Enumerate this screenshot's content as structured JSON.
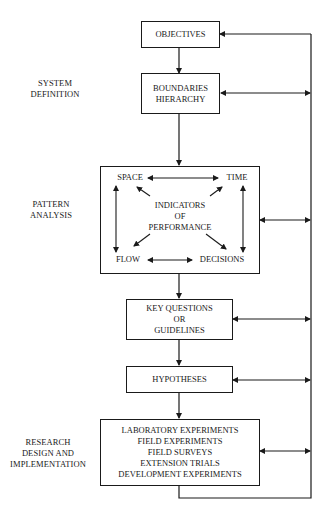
{
  "section_labels": {
    "system_definition": [
      "SYSTEM",
      "DEFINITION"
    ],
    "pattern_analysis": [
      "PATTERN",
      "ANALYSIS"
    ],
    "research_design": [
      "RESEARCH",
      "DESIGN AND",
      "IMPLEMENTATION"
    ]
  },
  "boxes": {
    "objectives": [
      "OBJECTIVES"
    ],
    "boundaries": [
      "BOUNDARIES",
      "HIERARCHY"
    ],
    "pattern": {
      "space": "SPACE",
      "time": "TIME",
      "flow": "FLOW",
      "decisions": "DECISIONS",
      "center": [
        "INDICATORS",
        "OF",
        "PERFORMANCE"
      ]
    },
    "key_questions": [
      "KEY QUESTIONS",
      "OR",
      "GUIDELINES"
    ],
    "hypotheses": [
      "HYPOTHESES"
    ],
    "research": [
      "LABORATORY EXPERIMENTS",
      "FIELD EXPERIMENTS",
      "FIELD SURVEYS",
      "EXTENSION TRIALS",
      "DEVELOPMENT EXPERIMENTS"
    ]
  }
}
